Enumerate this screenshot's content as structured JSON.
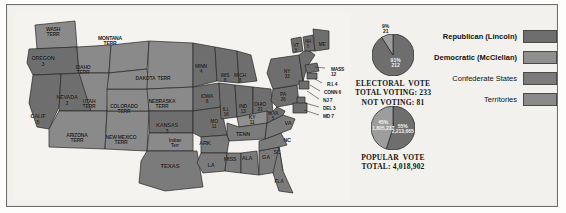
{
  "title": "1864",
  "map": {
    "name": "united-states-1864-election-map",
    "states": [
      {
        "label": "WASH\nTERR",
        "x": 38,
        "y": 16,
        "cls": "terr",
        "fs": 5
      },
      {
        "label": "OREGON\n3",
        "x": 28,
        "y": 45,
        "cls": "rep",
        "fs": 5.5
      },
      {
        "label": "CALIF\n5",
        "x": 23,
        "y": 103,
        "cls": "rep",
        "fs": 5.5
      },
      {
        "label": "NEVADA\n2",
        "x": 52,
        "y": 84,
        "cls": "rep",
        "fs": 5.5
      },
      {
        "label": "IDAHO\nTERR",
        "x": 68,
        "y": 54,
        "cls": "terr",
        "fs": 5
      },
      {
        "label": "MONTANA\nTERR",
        "x": 95,
        "y": 25,
        "cls": "terr",
        "fs": 5
      },
      {
        "label": "UTAH\nTERR",
        "x": 74,
        "y": 88,
        "cls": "terr",
        "fs": 5
      },
      {
        "label": "ARIZONA\nTERR",
        "x": 62,
        "y": 122,
        "cls": "terr",
        "fs": 5
      },
      {
        "label": "NEW MEXICO\nTERR",
        "x": 106,
        "y": 124,
        "cls": "terr",
        "fs": 5
      },
      {
        "label": "COLORADO\nTERR",
        "x": 109,
        "y": 93,
        "cls": "terr",
        "fs": 5
      },
      {
        "label": "DAKOTA  TERR",
        "x": 138,
        "y": 65,
        "cls": "terr",
        "fs": 5
      },
      {
        "label": "NEBRASKA\nTERR",
        "x": 147,
        "y": 88,
        "cls": "terr",
        "fs": 5
      },
      {
        "label": "KANSAS\n3",
        "x": 152,
        "y": 112,
        "cls": "rep",
        "fs": 5.5
      },
      {
        "label": "Indian\nTerr",
        "x": 160,
        "y": 128,
        "cls": "terr",
        "fs": 4.6
      },
      {
        "label": "TEXAS",
        "x": 155,
        "y": 152,
        "cls": "conf",
        "fs": 6
      },
      {
        "label": "MINN\n4",
        "x": 186,
        "y": 53,
        "cls": "rep",
        "fs": 5
      },
      {
        "label": "IOWA\n8",
        "x": 192,
        "y": 83,
        "cls": "rep",
        "fs": 5
      },
      {
        "label": "WIS\n8",
        "x": 210,
        "y": 62,
        "cls": "rep",
        "fs": 5
      },
      {
        "label": "MO\n11",
        "x": 199,
        "y": 108,
        "cls": "rep",
        "fs": 5
      },
      {
        "label": "ARK",
        "x": 190,
        "y": 130,
        "cls": "conf",
        "fs": 5.5
      },
      {
        "label": "LA",
        "x": 196,
        "y": 152,
        "cls": "conf",
        "fs": 5.5
      },
      {
        "label": "MISS",
        "x": 215,
        "y": 146,
        "cls": "conf",
        "fs": 5.5
      },
      {
        "label": "ALA",
        "x": 232,
        "y": 145,
        "cls": "conf",
        "fs": 5.5
      },
      {
        "label": "GA",
        "x": 251,
        "y": 144,
        "cls": "conf",
        "fs": 5.5
      },
      {
        "label": "FLA",
        "x": 264,
        "y": 168,
        "cls": "conf",
        "fs": 5
      },
      {
        "label": "TENN",
        "x": 228,
        "y": 121,
        "cls": "conf",
        "fs": 5.5
      },
      {
        "label": "KY\n11",
        "x": 237,
        "y": 104,
        "cls": "dem",
        "fs": 5
      },
      {
        "label": "ILL\n16",
        "x": 211,
        "y": 96,
        "cls": "rep",
        "fs": 5
      },
      {
        "label": "IND\n13",
        "x": 228,
        "y": 93,
        "cls": "rep",
        "fs": 5
      },
      {
        "label": "OHIO\n21",
        "x": 245,
        "y": 91,
        "cls": "rep",
        "fs": 5
      },
      {
        "label": "MICH\n8",
        "x": 225,
        "y": 62,
        "cls": "rep",
        "fs": 5
      },
      {
        "label": "W.VA\n5",
        "x": 258,
        "y": 101,
        "cls": "rep",
        "fs": 4.6
      },
      {
        "label": "VA",
        "x": 273,
        "y": 110,
        "cls": "conf",
        "fs": 5.5
      },
      {
        "label": "NC",
        "x": 272,
        "y": 127,
        "cls": "conf",
        "fs": 5.5
      },
      {
        "label": "SC",
        "x": 262,
        "y": 139,
        "cls": "conf",
        "fs": 5.5
      },
      {
        "label": "PA\n26",
        "x": 268,
        "y": 81,
        "cls": "rep",
        "fs": 5
      },
      {
        "label": "NY\n33",
        "x": 272,
        "y": 58,
        "cls": "rep",
        "fs": 5
      },
      {
        "label": "VT\n5",
        "x": 281,
        "y": 33,
        "cls": "rep",
        "fs": 4.6
      },
      {
        "label": "NH\n5",
        "x": 293,
        "y": 29,
        "cls": "rep",
        "fs": 4.6
      },
      {
        "label": "ME",
        "x": 307,
        "y": 31,
        "cls": "rep",
        "fs": 5
      }
    ],
    "callouts": [
      {
        "label": "MASS\n12",
        "x": 316,
        "y": 57
      },
      {
        "label": "R.I. 4",
        "x": 312,
        "y": 72
      },
      {
        "label": "CONN 6",
        "x": 309,
        "y": 80
      },
      {
        "label": "NJ 7",
        "x": 308,
        "y": 88
      },
      {
        "label": "DEL 3",
        "x": 308,
        "y": 96
      },
      {
        "label": "MD 7",
        "x": 308,
        "y": 104
      }
    ]
  },
  "chart_data": [
    {
      "type": "pie",
      "name": "electoral-vote-pie",
      "title": "ELECTORAL  VOTE",
      "caption_lines": [
        "ELECTORAL  VOTE",
        "TOTAL VOTING: 233",
        "NOT VOTING: 81"
      ],
      "total_voting": 233,
      "not_voting": 81,
      "slices": [
        {
          "name": "Republican (Lincoln)",
          "percent": 91,
          "value": 212,
          "label": "91%\n212",
          "color": "#6e6e6e"
        },
        {
          "name": "Democratic (McClellan)",
          "percent": 9,
          "value": 21,
          "label": "9%\n21",
          "color": "#9d9d9d"
        }
      ]
    },
    {
      "type": "pie",
      "name": "popular-vote-pie",
      "title": "POPULAR  VOTE",
      "caption_lines": [
        "POPULAR  VOTE",
        "TOTAL: 4,018,902"
      ],
      "total": "4,018,902",
      "slices": [
        {
          "name": "Republican (Lincoln)",
          "percent": 55,
          "value": "2,213,665",
          "label": "55%\n2,213,665",
          "color": "#6e6e6e"
        },
        {
          "name": "Democratic (McClellan)",
          "percent": 45,
          "value": "1,805,237",
          "label": "45%\n1,805,237",
          "color": "#9d9d9d"
        }
      ]
    }
  ],
  "legend": {
    "name": "map-legend",
    "items": [
      {
        "label": "Republican (Lincoln)",
        "bold": true,
        "color": "#6e6e6e"
      },
      {
        "label": "Democratic (McClellan)",
        "bold": true,
        "color": "#8f8f8f"
      },
      {
        "label": "Confederate States",
        "bold": false,
        "color": "#7b7b7b"
      },
      {
        "label": "Territories",
        "bold": false,
        "color": "#8a8a8a"
      }
    ]
  },
  "colors": {
    "republican": "#6e6e6e",
    "democratic": "#8f8f8f",
    "confederate": "#7b7b7b",
    "territory": "#8a8a8a",
    "water": "#f4f3f0",
    "outline": "#2b2b2b",
    "frame": "#6f6f6f",
    "page_bg": "#f2f1ee"
  }
}
